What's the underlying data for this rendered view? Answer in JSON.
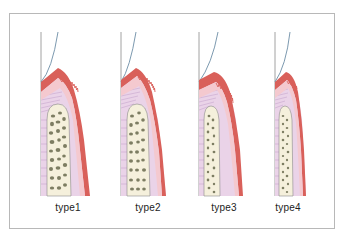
{
  "diagram": {
    "title": "",
    "panels": [
      {
        "id": "type1",
        "label": "type1"
      },
      {
        "id": "type2",
        "label": "type2"
      },
      {
        "id": "type3",
        "label": "type3"
      },
      {
        "id": "type4",
        "label": "type4"
      }
    ],
    "colors": {
      "gingiva_outer": "#d9605a",
      "gingiva_inner": "#f4c9cf",
      "connective_tissue": "#ead3e8",
      "bone_fill": "#f5f0dc",
      "bone_trabeculae": "#7d7d62",
      "tooth": "#ffffff",
      "tooth_outline": "#8a8a8a",
      "enamel_curve": "#5a7f9a",
      "frame_border": "#b8b8b8",
      "label_text": "#222222"
    }
  }
}
